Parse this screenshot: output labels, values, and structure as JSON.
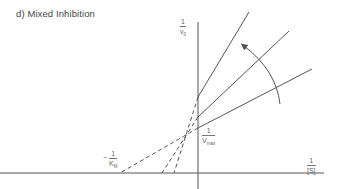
{
  "title": "d) Mixed Inhibition",
  "labels": {
    "y_axis": {
      "num": "1",
      "den": "v",
      "den_sub": "0"
    },
    "x_axis": {
      "num": "1",
      "den": "[S]"
    },
    "y_intercept": {
      "num": "1",
      "den": "V",
      "den_sub": "max"
    },
    "x_intercept": {
      "sign": "−",
      "num": "1",
      "den": "K",
      "den_sub": "M"
    }
  },
  "colors": {
    "line": "#555555",
    "axis": "#555555",
    "background": "#ffffff"
  },
  "diagram": {
    "type": "lineweaver-burk",
    "lines": [
      {
        "name": "steep-inhibitor-line",
        "y_intercept_px": 97,
        "end": [
          249,
          12
        ]
      },
      {
        "name": "middle-inhibitor-line",
        "y_intercept_px": 117,
        "end": [
          289,
          31
        ]
      },
      {
        "name": "no-inhibitor-line",
        "y_intercept_px": 128,
        "end": [
          312,
          69
        ]
      }
    ],
    "convergence_point": [
      175,
      140
    ],
    "arrow": "increasing inhibitor concentration (curved arrow pointing counter-clockwise)"
  }
}
